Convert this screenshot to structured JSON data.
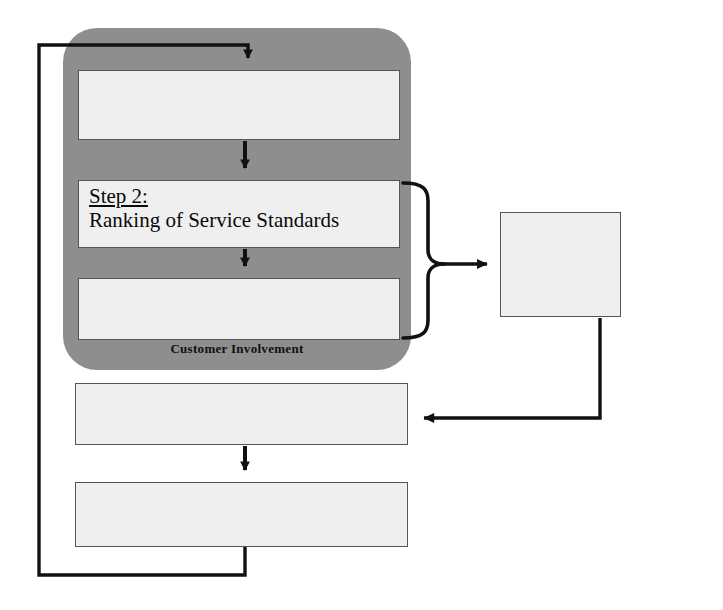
{
  "diagram": {
    "type": "flowchart",
    "colors": {
      "zone_fill": "#8e8e8e",
      "box_fill": "#efefef",
      "box_border": "#555555",
      "connector": "#111111",
      "text": "#0a0a0a",
      "page_background": "#ffffff"
    }
  },
  "zone": {
    "label": "Customer Involvement"
  },
  "boxes": {
    "identify": {
      "step": "",
      "text": ""
    },
    "ranking": {
      "step": "Step 2:",
      "text": "Ranking of Service Standards"
    },
    "target": {
      "step": "",
      "text": ""
    },
    "gap": {
      "step": "",
      "text": ""
    },
    "implement": {
      "step": "",
      "text": ""
    },
    "resources": {
      "step": "",
      "text": ""
    }
  },
  "connectors": [
    {
      "name": "feedback-loop",
      "from": "implement",
      "to": "identify",
      "style": "orthogonal",
      "arrow": "down"
    },
    {
      "name": "identify-to-ranking",
      "from": "identify",
      "to": "ranking",
      "style": "straight",
      "arrow": "down"
    },
    {
      "name": "ranking-to-target",
      "from": "ranking",
      "to": "target",
      "style": "straight",
      "arrow": "down"
    },
    {
      "name": "brace-to-resources",
      "from": "ranking+target",
      "to": "resources",
      "style": "curly-brace",
      "arrow": "right"
    },
    {
      "name": "resources-to-gap",
      "from": "resources",
      "to": "gap",
      "style": "orthogonal",
      "arrow": "left"
    },
    {
      "name": "gap-to-implement",
      "from": "gap",
      "to": "implement",
      "style": "straight",
      "arrow": "down"
    }
  ]
}
